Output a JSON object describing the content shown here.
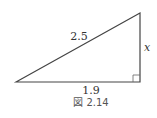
{
  "figure": {
    "caption": "図 2.14",
    "hypotenuse_label": "2.5",
    "base_label": "1.9",
    "height_label": "x",
    "line_color": "#333333"
  }
}
